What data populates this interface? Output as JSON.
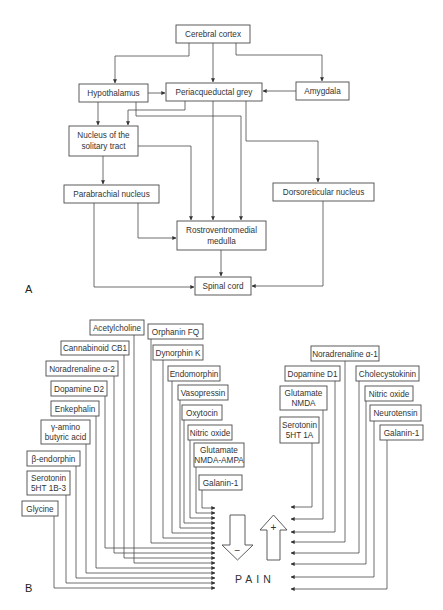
{
  "panel_a": {
    "label": "A",
    "nodes": {
      "cerebral_cortex": "Cerebral cortex",
      "hypothalamus": "Hypothalamus",
      "pag": "Periacqueductal grey",
      "amygdala": "Amygdala",
      "nts_1": "Nucleus of the",
      "nts_2": "solitary tract",
      "parabrachial": "Parabrachial nucleus",
      "dorsoreticular": "Dorsoreticular nucleus",
      "rvm_1": "Rostroventromedial",
      "rvm_2": "medulla",
      "spinal_cord": "Spinal cord"
    }
  },
  "panel_b": {
    "label": "B",
    "center_label": "PAIN",
    "down_arrow_sign": "−",
    "up_arrow_sign": "+",
    "inhibitory": [
      {
        "l1": "Acetylcholine"
      },
      {
        "l1": "Cannabinoid CB1"
      },
      {
        "l1": "Noradrenaline α-2"
      },
      {
        "l1": "Dopamine D2"
      },
      {
        "l1": "Enkephalin"
      },
      {
        "l1": "γ-amino",
        "l2": "butyric acid"
      },
      {
        "l1": "β-endorphin"
      },
      {
        "l1": "Serotonin",
        "l2": "5HT 1B-3"
      },
      {
        "l1": "Glycine"
      },
      {
        "l1": "Orphanin FQ"
      },
      {
        "l1": "Dynorphin K"
      },
      {
        "l1": "Endomorphin"
      },
      {
        "l1": "Vasopressin"
      },
      {
        "l1": "Oxytocin"
      },
      {
        "l1": "Nitric oxide"
      },
      {
        "l1": "Glutamate",
        "l2": "NMDA-AMPA"
      },
      {
        "l1": "Galanin-1"
      }
    ],
    "excitatory": [
      {
        "l1": "Noradrenaline α-1"
      },
      {
        "l1": "Dopamine D1"
      },
      {
        "l1": "Glutamate",
        "l2": "NMDA"
      },
      {
        "l1": "Serotonin",
        "l2": "5HT 1A"
      },
      {
        "l1": "Cholecystokinin"
      },
      {
        "l1": "Nitric oxide"
      },
      {
        "l1": "Neurotensin"
      },
      {
        "l1": "Galanin-1"
      }
    ]
  },
  "colors": {
    "line": "#4a4a4a",
    "text": "#333333",
    "background": "#ffffff"
  }
}
